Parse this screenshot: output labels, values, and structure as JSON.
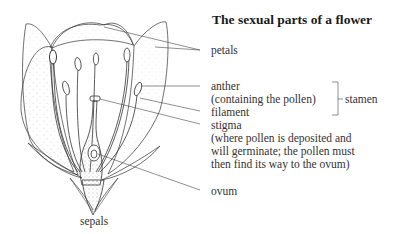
{
  "title": "The sexual parts of a flower",
  "labels": {
    "petals": "petals",
    "anther": "anther",
    "anther_note": "(containing the pollen)",
    "filament": "filament",
    "stamen": "stamen",
    "stigma": "stigma",
    "stigma_note_1": "(where pollen is deposited and",
    "stigma_note_2": "will germinate; the pollen must",
    "stigma_note_3": "then find its way to the ovum)",
    "ovum": "ovum",
    "sepals": "sepals"
  },
  "colors": {
    "line": "#333333",
    "stipple": "#777777",
    "background": "#ffffff"
  }
}
